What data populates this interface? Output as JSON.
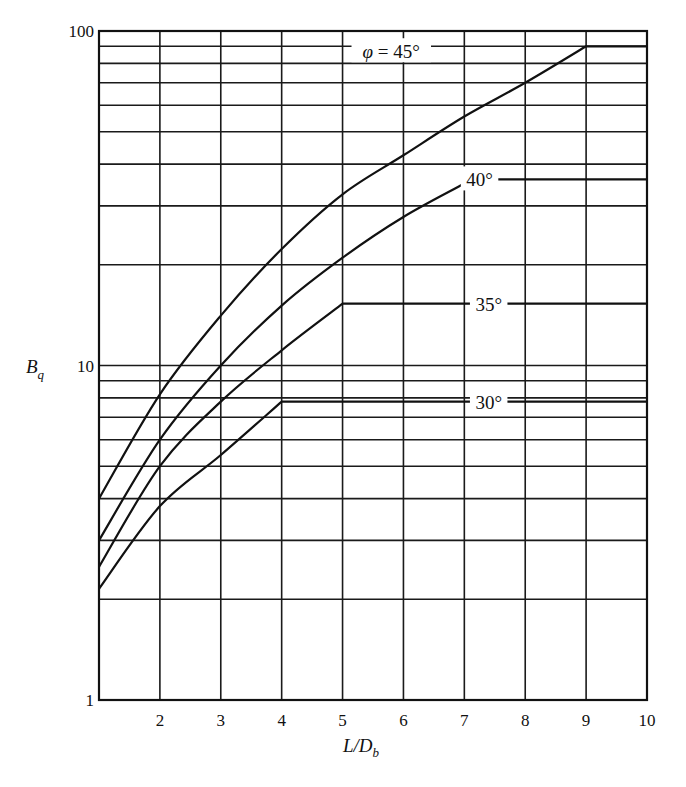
{
  "chart_data": {
    "type": "line",
    "title": "",
    "xlabel": "L/D_b",
    "xlabel_main": "L/D",
    "xlabel_sub": "b",
    "ylabel": "B_q",
    "ylabel_main": "B",
    "ylabel_sub": "q",
    "xscale": "linear",
    "yscale": "log",
    "xlim": [
      1,
      10
    ],
    "ylim": [
      1,
      100
    ],
    "grid": true,
    "legend": "inline labels on curves",
    "x_ticks": [
      2,
      3,
      4,
      5,
      6,
      7,
      8,
      9,
      10
    ],
    "x_tick_labels": [
      "2",
      "3",
      "4",
      "5",
      "6",
      "7",
      "8",
      "9",
      "10"
    ],
    "y_ticks": [
      1,
      10,
      100
    ],
    "y_tick_labels": [
      "1",
      "10",
      "100"
    ],
    "y_minor_grid": [
      2,
      3,
      4,
      5,
      6,
      7,
      8,
      9,
      20,
      30,
      40,
      50,
      60,
      70,
      80,
      90
    ],
    "series": [
      {
        "name": "φ = 45°",
        "label": "φ = 45°",
        "label_at": [
          5.8,
          87
        ],
        "x": [
          1,
          2,
          3,
          4,
          5,
          6,
          7,
          8,
          9,
          10
        ],
        "y": [
          4.0,
          8.2,
          14.1,
          22.3,
          32.5,
          42.5,
          55.5,
          70,
          90,
          90
        ]
      },
      {
        "name": "40°",
        "label": "40°",
        "label_at": [
          7.25,
          36
        ],
        "x": [
          1,
          2,
          3,
          4,
          5,
          6,
          7,
          7.1,
          10
        ],
        "y": [
          3.0,
          6.0,
          10.0,
          15.1,
          21.0,
          27.8,
          35.0,
          36,
          36
        ]
      },
      {
        "name": "35°",
        "label": "35°",
        "label_at": [
          7.4,
          15.3
        ],
        "x": [
          1,
          2,
          3,
          4,
          5,
          10
        ],
        "y": [
          2.5,
          5.0,
          7.8,
          11.1,
          15.3,
          15.3
        ]
      },
      {
        "name": "30°",
        "label": "30°",
        "label_at": [
          7.4,
          7.8
        ],
        "x": [
          1,
          2,
          3,
          4,
          10
        ],
        "y": [
          2.15,
          3.8,
          5.4,
          7.8,
          7.8
        ]
      }
    ]
  }
}
